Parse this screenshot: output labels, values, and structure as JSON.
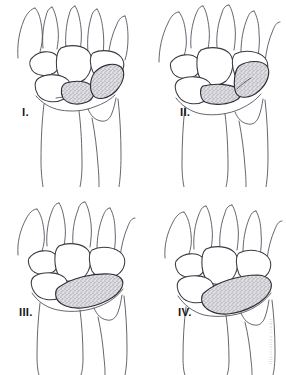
{
  "figure": {
    "view": "posteroanterior wrist",
    "background_color": "#ffffff",
    "line_color": "#3a3a42",
    "highlight_fill_color": "#d9d9de",
    "highlight_stipple_color": "#6e6e7a",
    "label_color": "#1a1a1a",
    "signature": "illustration credit",
    "panel_count": 4,
    "grid": "2x2"
  },
  "panels": [
    {
      "id": "panel-1",
      "label": "I.",
      "highlighted_structure": "scaphoid-lunate region",
      "highlight_shape": "two short adjacent stippled segments, proximal carpal row",
      "position": "top-left"
    },
    {
      "id": "panel-2",
      "label": "II.",
      "highlighted_structure": "scaphoid-lunate region",
      "highlight_shape": "angled stippled band extending distally-laterally",
      "position": "top-right"
    },
    {
      "id": "panel-3",
      "label": "III.",
      "highlighted_structure": "proximal carpal row",
      "highlight_shape": "long flat crescent stippled band",
      "position": "bottom-left"
    },
    {
      "id": "panel-4",
      "label": "IV.",
      "highlighted_structure": "proximal carpal row",
      "highlight_shape": "long curved crescent stippled band, widest laterally",
      "position": "bottom-right"
    }
  ],
  "anatomy": {
    "metacarpals": "metacarpal bases, top of each panel",
    "distal_carpal_row": "trapezium, trapezoid, capitate, hamate",
    "proximal_carpal_row": "scaphoid, lunate, triquetrum",
    "forearm_bones": [
      "radius",
      "ulna"
    ]
  }
}
